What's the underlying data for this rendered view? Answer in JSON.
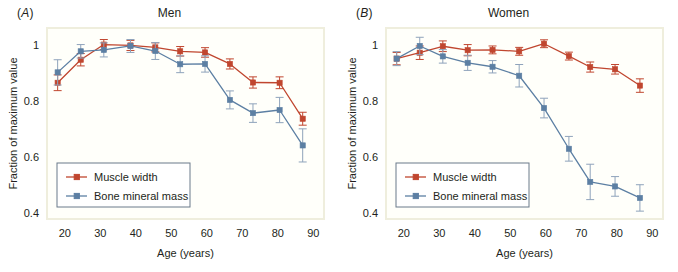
{
  "figure": {
    "background_color": "#ffffff",
    "plot_background_color": "#fffffa",
    "plot_border_color": "#efeedd",
    "text_color": "#231f20"
  },
  "series_colors": {
    "muscle_width": "#c0462f",
    "bone_mineral_mass": "#5c7fa3",
    "error_bar_muscle": "#c0462f",
    "error_bar_bone": "#8fa3bb"
  },
  "panels": [
    {
      "tag_open": "(",
      "tag_letter": "A",
      "tag_close": ")",
      "title": "Men",
      "legend": {
        "items": [
          {
            "label": "Muscle width",
            "color_key": "muscle_width"
          },
          {
            "label": "Bone mineral mass",
            "color_key": "bone_mineral_mass"
          }
        ]
      },
      "chart_data": {
        "type": "line",
        "title": "Men",
        "xlabel": "Age (years)",
        "ylabel": "Fraction of maximum value",
        "xlim": [
          15,
          93
        ],
        "ylim": [
          0.38,
          1.06
        ],
        "xticks": [
          20,
          30,
          40,
          50,
          60,
          70,
          80,
          90
        ],
        "yticks": [
          0.4,
          0.6,
          0.8,
          1.0
        ],
        "grid": false,
        "legend_position": "lower-left",
        "series": [
          {
            "name": "Muscle width",
            "color": "#c0462f",
            "x": [
              18,
              24.5,
              31,
              38.5,
              45.5,
              52.5,
              59.5,
              66.5,
              73,
              80.5,
              87
            ],
            "y": [
              0.865,
              0.947,
              1.001,
              0.998,
              0.991,
              0.977,
              0.973,
              0.932,
              0.866,
              0.865,
              0.737
            ],
            "yerr": [
              0.028,
              0.022,
              0.018,
              0.018,
              0.016,
              0.017,
              0.017,
              0.018,
              0.02,
              0.021,
              0.023
            ]
          },
          {
            "name": "Bone mineral mass",
            "color": "#5c7fa3",
            "x": [
              18,
              24.5,
              31,
              38.5,
              45.5,
              52.5,
              59.5,
              66.5,
              73,
              80.5,
              87
            ],
            "y": [
              0.902,
              0.977,
              0.982,
              0.996,
              0.978,
              0.931,
              0.932,
              0.804,
              0.757,
              0.768,
              0.642
            ],
            "yerr": [
              0.045,
              0.024,
              0.025,
              0.023,
              0.03,
              0.03,
              0.029,
              0.032,
              0.033,
              0.045,
              0.059
            ]
          }
        ]
      }
    },
    {
      "tag_open": "(",
      "tag_letter": "B",
      "tag_close": ")",
      "title": "Women",
      "legend": {
        "items": [
          {
            "label": "Muscle width",
            "color_key": "muscle_width"
          },
          {
            "label": "Bone mineral mass",
            "color_key": "bone_mineral_mass"
          }
        ]
      },
      "chart_data": {
        "type": "line",
        "title": "Women",
        "xlabel": "Age (years)",
        "ylabel": "Fraction of maximum value",
        "xlim": [
          15,
          93
        ],
        "ylim": [
          0.38,
          1.06
        ],
        "xticks": [
          20,
          30,
          40,
          50,
          60,
          70,
          80,
          90
        ],
        "yticks": [
          0.4,
          0.6,
          0.8,
          1.0
        ],
        "grid": false,
        "legend_position": "lower-left",
        "series": [
          {
            "name": "Muscle width",
            "color": "#c0462f",
            "x": [
              18,
              24.5,
              31,
              38,
              45,
              52.5,
              59.5,
              66.5,
              72.5,
              79.5,
              86.5
            ],
            "y": [
              0.951,
              0.972,
              0.995,
              0.981,
              0.982,
              0.977,
              1.004,
              0.96,
              0.921,
              0.913,
              0.855
            ],
            "yerr": [
              0.022,
              0.024,
              0.019,
              0.02,
              0.014,
              0.014,
              0.014,
              0.014,
              0.018,
              0.017,
              0.024
            ]
          },
          {
            "name": "Bone mineral mass",
            "color": "#5c7fa3",
            "x": [
              18,
              24.5,
              31,
              38,
              45,
              52.5,
              59.5,
              66.5,
              72.5,
              79.5,
              86.5
            ],
            "y": [
              0.951,
              0.996,
              0.959,
              0.936,
              0.922,
              0.89,
              0.775,
              0.63,
              0.512,
              0.496,
              0.455
            ],
            "yerr": [
              0.025,
              0.031,
              0.024,
              0.027,
              0.022,
              0.04,
              0.035,
              0.044,
              0.063,
              0.035,
              0.047
            ]
          }
        ]
      }
    }
  ]
}
